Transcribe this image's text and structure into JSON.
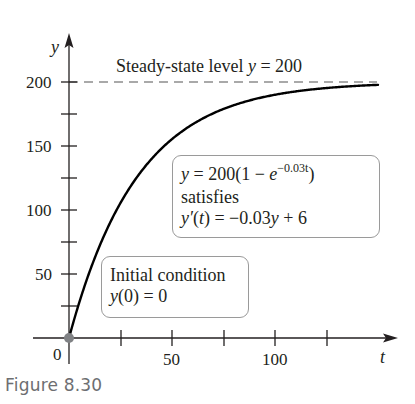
{
  "chart_data": {
    "type": "line",
    "title": "Steady-state level y = 200",
    "xlabel": "t",
    "ylabel": "y",
    "xlim": [
      0,
      150
    ],
    "ylim": [
      0,
      200
    ],
    "x_ticks": [
      0,
      25,
      50,
      75,
      100,
      125
    ],
    "x_tick_labels": [
      "0",
      "",
      "50",
      "",
      "100",
      ""
    ],
    "y_ticks": [
      25,
      50,
      75,
      100,
      125,
      150,
      175,
      200
    ],
    "y_tick_labels": [
      "",
      "50",
      "",
      "100",
      "",
      "150",
      "",
      "200"
    ],
    "grid": false,
    "series": [
      {
        "name": "y = 200(1 - e^(-0.03t))",
        "function": "200*(1-exp(-0.03*t))",
        "x": [
          0,
          10,
          20,
          30,
          40,
          50,
          60,
          75,
          100,
          125,
          150
        ],
        "y": [
          0,
          51.8,
          90.2,
          118.7,
          139.8,
          155.4,
          167.0,
          178.9,
          190.0,
          195.3,
          197.8
        ],
        "style": "solid"
      },
      {
        "name": "Steady-state level",
        "x": [
          0,
          150
        ],
        "y": [
          200,
          200
        ],
        "style": "dashed"
      }
    ],
    "points": [
      {
        "t": 0,
        "y": 0,
        "label": "y(0) = 0"
      }
    ],
    "annotations": [
      "Steady-state level y = 200",
      "y = 200(1 − e^(−0.03t)) satisfies y′(t) = −0.03y + 6",
      "Initial condition y(0) = 0"
    ]
  },
  "labels": {
    "y_axis": "y",
    "t_axis": "t",
    "origin": "0",
    "x_ticks": {
      "t50": "50",
      "t100": "100"
    },
    "y_ticks": {
      "y50": "50",
      "y100": "100",
      "y150": "150",
      "y200": "200"
    },
    "steady_state_prefix": "Steady-state level ",
    "steady_state_var": "y",
    "steady_state_suffix": " = 200"
  },
  "formula_box": {
    "line1_a": "y",
    "line1_b": " = 200(1 − ",
    "line1_c": "e",
    "line1_exp": "−0.03t",
    "line1_d": ")",
    "line2": "satisfies",
    "line3_a": "y′",
    "line3_b": "(",
    "line3_c": "t",
    "line3_d": ") = −0.03",
    "line3_e": "y",
    "line3_f": " + 6"
  },
  "initial_box": {
    "line1": "Initial condition",
    "line2_a": "y",
    "line2_b": "(0) = 0"
  },
  "caption": "Figure 8.30",
  "colors": {
    "axis": "#231f20",
    "curve": "#000000",
    "dash": "#555555",
    "origin_dot": "#808285",
    "box_border": "#9a9a9a",
    "caption": "#6d6e71"
  }
}
